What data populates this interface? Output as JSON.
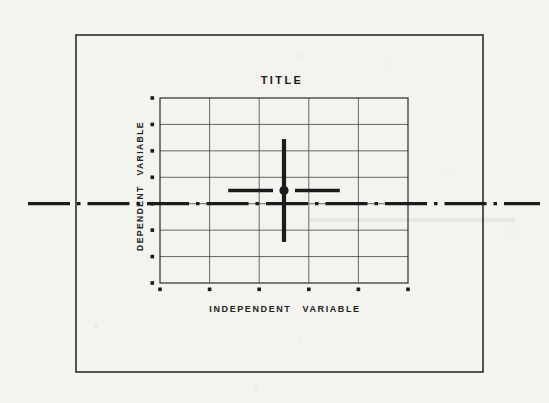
{
  "figure": {
    "title": "TITLE",
    "x_axis_label": "INDEPENDENT VARIABLE",
    "y_axis_label": "DEPENDENT VARIABLE"
  },
  "chart_data": {
    "type": "scatter",
    "title": "TITLE",
    "xlabel": "INDEPENDENT VARIABLE",
    "ylabel": "DEPENDENT VARIABLE",
    "grid": true,
    "grid_columns": 5,
    "grid_rows": 7,
    "x_tick_labels": [],
    "y_tick_labels": [],
    "tick_marker": "small-filled-square",
    "points": [
      {
        "marker": "filled-circle",
        "x_fraction": 0.5,
        "y_fraction": 0.5,
        "x_error_fraction": 0.225,
        "y_error_fraction": 0.278
      }
    ],
    "reference_line": {
      "orientation": "horizontal",
      "y_fraction": 0.4286,
      "style": "dash-dot",
      "extends_beyond_plot": true
    },
    "ink_color": "#1b1b1b",
    "grid_color": "#3d3d3d",
    "paper_color": "#f4f3ef"
  }
}
